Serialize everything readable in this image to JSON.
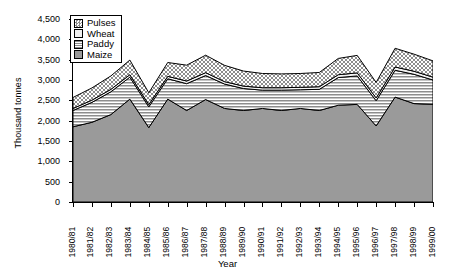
{
  "chart_data": {
    "type": "area",
    "stacked": true,
    "title": "",
    "xlabel": "Year",
    "ylabel": "Thousand tonnes",
    "ylim": [
      0,
      4500
    ],
    "ytick_labels": [
      "0",
      "500",
      "1,000",
      "1,500",
      "2,000",
      "2,500",
      "3,000",
      "3,500",
      "4,000",
      "4,500"
    ],
    "ytick_values": [
      0,
      500,
      1000,
      1500,
      2000,
      2500,
      3000,
      3500,
      4000,
      4500
    ],
    "grid": false,
    "legend_position": "top-left",
    "categories": [
      "1980/81",
      "1981/82",
      "1982/83",
      "1983/84",
      "1984/85",
      "1985/86",
      "1986/87",
      "1987/88",
      "1988/89",
      "1989/90",
      "1990/91",
      "1991/92",
      "1992/93",
      "1993/94",
      "1994/95",
      "1995/96",
      "1996/97",
      "1997/98",
      "1998/99",
      "1999/00"
    ],
    "series": [
      {
        "name": "Maize",
        "order": 0,
        "pattern": "solid-gray",
        "color": "#9a9a9a",
        "values": [
          1850,
          1960,
          2150,
          2530,
          1830,
          2530,
          2250,
          2520,
          2300,
          2250,
          2300,
          2250,
          2300,
          2250,
          2380,
          2400,
          1870,
          2580,
          2420,
          2400
        ]
      },
      {
        "name": "Paddy",
        "order": 1,
        "pattern": "horizontal-lines",
        "color": "#d8d8d8",
        "values": [
          400,
          490,
          560,
          540,
          510,
          500,
          660,
          590,
          600,
          540,
          450,
          500,
          460,
          520,
          680,
          700,
          620,
          660,
          720,
          600
        ]
      },
      {
        "name": "Wheat",
        "order": 2,
        "pattern": "light-solid",
        "color": "#f0f0f0",
        "values": [
          50,
          55,
          60,
          60,
          55,
          60,
          65,
          70,
          60,
          60,
          60,
          60,
          60,
          65,
          70,
          75,
          70,
          80,
          75,
          70
        ]
      },
      {
        "name": "Pulses",
        "order": 3,
        "pattern": "stipple-dots",
        "color": "#cfcfcf",
        "values": [
          270,
          300,
          330,
          360,
          290,
          340,
          390,
          430,
          400,
          370,
          350,
          340,
          340,
          350,
          400,
          430,
          380,
          460,
          420,
          400
        ]
      }
    ],
    "totals": [
      2570,
      2805,
      3100,
      3490,
      2685,
      3430,
      3365,
      3610,
      3360,
      3220,
      3160,
      3150,
      3160,
      3185,
      3530,
      3605,
      2940,
      3780,
      3635,
      3470
    ]
  },
  "legend": {
    "items": [
      {
        "label": "Pulses"
      },
      {
        "label": "Wheat"
      },
      {
        "label": "Paddy"
      },
      {
        "label": "Maize"
      }
    ]
  }
}
